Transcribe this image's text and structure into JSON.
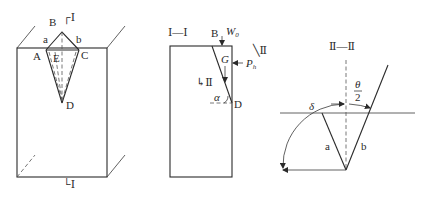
{
  "figure1": {
    "section_top": "┌Ⅰ",
    "section_bottom": "└Ⅰ",
    "points": {
      "B": "B",
      "a": "a",
      "b": "b",
      "A": "A",
      "C": "C",
      "E": "E",
      "D": "D"
    }
  },
  "figure2": {
    "title": "Ⅰ—Ⅰ",
    "B": "B",
    "W0": "W",
    "W0_sub": "0",
    "G": "G",
    "Ph": "P",
    "Ph_sub": "h",
    "section_right": "╲Ⅱ",
    "section_left": "↳Ⅱ",
    "alpha": "α",
    "D": "D"
  },
  "figure3": {
    "title": "Ⅱ—Ⅱ",
    "theta_num": "θ",
    "theta_den": "2",
    "delta": "δ",
    "a": "a",
    "b": "b"
  }
}
